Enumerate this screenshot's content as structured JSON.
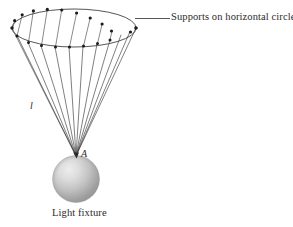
{
  "figure": {
    "title_absent": true,
    "background_color": "#ffffff",
    "ink_color": "#2b2b2b",
    "labels": {
      "supports": "Supports on horizontal circle",
      "fixture": "Light fixture",
      "cable_length": "l",
      "attachment_point": "A"
    },
    "leader_line": {
      "name": "supports-leader-line",
      "x1": 136,
      "y1": 18,
      "x2": 170,
      "y2": 18
    },
    "ring": {
      "name": "horizontal-support-circle",
      "center_x": 74,
      "center_y": 28,
      "radius_x": 62,
      "radius_y": 19,
      "support_count": 16
    },
    "apex": {
      "name": "cable-convergence-point",
      "x": 76,
      "y": 156
    },
    "sphere": {
      "name": "light-fixture-sphere",
      "center_x": 76,
      "center_y": 179,
      "radius": 23,
      "highlight_color": "#e8e8e8",
      "base_color": "#a8a8a8",
      "shadow_color": "#8f8f8f"
    },
    "support_points": [
      {
        "index": 0,
        "x": 136.0,
        "y": 28.0,
        "front": false
      },
      {
        "index": 1,
        "x": 133.3,
        "y": 35.3,
        "front": true
      },
      {
        "index": 2,
        "x": 125.8,
        "y": 41.2,
        "front": true
      },
      {
        "index": 3,
        "x": 114.6,
        "y": 45.1,
        "front": true
      },
      {
        "index": 4,
        "x": 100.7,
        "y": 46.6,
        "front": true
      },
      {
        "index": 5,
        "x": 86.3,
        "y": 46.0,
        "front": true
      },
      {
        "index": 6,
        "x": 71.4,
        "y": 43.0,
        "front": true
      },
      {
        "index": 7,
        "x": 57.8,
        "y": 38.0,
        "front": true
      },
      {
        "index": 8,
        "x": 45.9,
        "y": 32.0,
        "front": true
      },
      {
        "index": 9,
        "x": 12.0,
        "y": 28.0,
        "front": false
      },
      {
        "index": 10,
        "x": 14.7,
        "y": 20.7,
        "front": false
      },
      {
        "index": 11,
        "x": 22.2,
        "y": 14.8,
        "front": false
      },
      {
        "index": 12,
        "x": 33.4,
        "y": 10.9,
        "front": false
      },
      {
        "index": 13,
        "x": 47.3,
        "y": 9.4,
        "front": false
      },
      {
        "index": 14,
        "x": 61.7,
        "y": 10.0,
        "front": false
      },
      {
        "index": 15,
        "x": 76.6,
        "y": 13.0,
        "front": false
      },
      {
        "index": 16,
        "x": 90.2,
        "y": 18.0,
        "front": false
      },
      {
        "index": 17,
        "x": 102.1,
        "y": 24.0,
        "front": false
      },
      {
        "index": 18,
        "x": 112.0,
        "y": 31.0,
        "front": true
      },
      {
        "index": 19,
        "x": 119.0,
        "y": 22.0,
        "front": false
      }
    ]
  }
}
